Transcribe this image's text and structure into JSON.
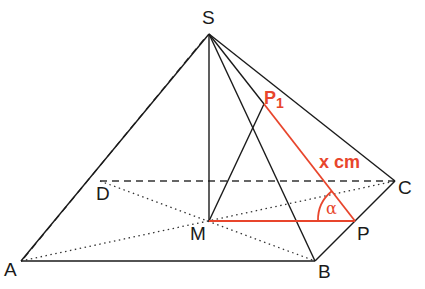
{
  "diagram": {
    "type": "square pyramid",
    "labels": {
      "S": "S",
      "A": "A",
      "B": "B",
      "C": "C",
      "D": "D",
      "M": "M",
      "P": "P",
      "P1_main": "P",
      "P1_sub": "1",
      "length": "x cm",
      "angle": "α"
    },
    "colors": {
      "edge": "#1a1a1a",
      "highlight": "#e8452c"
    }
  }
}
